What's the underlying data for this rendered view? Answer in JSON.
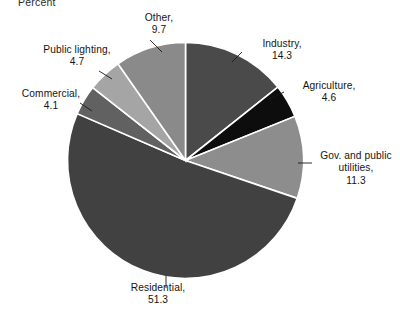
{
  "axis": {
    "title": "Percent"
  },
  "chart_data": {
    "type": "pie",
    "title": "Percent",
    "xlabel": "",
    "ylabel": "Percent",
    "units": "percent",
    "total": 100.0,
    "start_angle_deg": 0,
    "direction": "clockwise",
    "legend": "none",
    "grid": false,
    "categories": [
      "Industry",
      "Agriculture",
      "Gov. and public utilities",
      "Residential",
      "Commercial",
      "Public lighting",
      "Other"
    ],
    "values": [
      14.3,
      4.6,
      11.3,
      51.3,
      4.1,
      4.7,
      9.7
    ],
    "colors": [
      "#4a4a4a",
      "#0d0d0d",
      "#8d8d8d",
      "#414141",
      "#616161",
      "#a5a5a5",
      "#8a8a8a"
    ],
    "slices": [
      {
        "name": "Industry",
        "value": 14.3,
        "label_text": "Industry,",
        "label_value": "14.3",
        "color": "#4a4a4a"
      },
      {
        "name": "Agriculture",
        "value": 4.6,
        "label_text": "Agriculture,",
        "label_value": "4.6",
        "color": "#0d0d0d"
      },
      {
        "name": "Gov. and public utilities",
        "value": 11.3,
        "label_line1": "Gov. and public",
        "label_line2": "utilities,",
        "label_value": "11.3",
        "color": "#8d8d8d"
      },
      {
        "name": "Residential",
        "value": 51.3,
        "label_text": "Residential,",
        "label_value": "51.3",
        "color": "#414141"
      },
      {
        "name": "Commercial",
        "value": 4.1,
        "label_text": "Commercial,",
        "label_value": "4.1",
        "color": "#616161"
      },
      {
        "name": "Public lighting",
        "value": 4.7,
        "label_text": "Public lighting,",
        "label_value": "4.7",
        "color": "#a5a5a5"
      },
      {
        "name": "Other",
        "value": 9.7,
        "label_text": "Other,",
        "label_value": "9.7",
        "color": "#8a8a8a"
      }
    ]
  },
  "labels": {
    "other": {
      "line1": "Other,",
      "line2": "9.7"
    },
    "public_lighting": {
      "line1": "Public lighting,",
      "line2": "4.7"
    },
    "commercial": {
      "line1": "Commercial,",
      "line2": "4.1"
    },
    "residential": {
      "line1": "Residential,",
      "line2": "51.3"
    },
    "industry": {
      "line1": "Industry,",
      "line2": "14.3"
    },
    "agriculture": {
      "line1": "Agriculture,",
      "line2": "4.6"
    },
    "gov_utilities": {
      "line1": "Gov. and public",
      "line2": "utilities,",
      "line3": "11.3"
    }
  }
}
